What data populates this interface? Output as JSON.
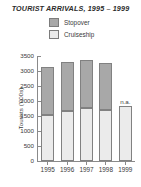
{
  "chart_data": {
    "type": "bar",
    "subtype": "stacked-bar",
    "title": "TOURIST ARRIVALS, 1995 – 1999",
    "xlabel": "",
    "ylabel": "Tourists ('000s)",
    "categories": [
      "1995",
      "1996",
      "1997",
      "1998",
      "1999"
    ],
    "series": [
      {
        "name": "Cruiseship",
        "color": "#ebebeb",
        "values": [
          1520,
          1680,
          1760,
          1710,
          1840
        ]
      },
      {
        "name": "Stopover",
        "color": "#a8a8a8",
        "values": [
          1630,
          1630,
          1610,
          1560,
          null
        ]
      }
    ],
    "totals": [
      3150,
      3310,
      3370,
      3270,
      1840
    ],
    "ylim": [
      0,
      3500
    ],
    "yticks": [
      0,
      500,
      1000,
      1500,
      2000,
      2500,
      3000,
      3500
    ],
    "ytick_labels": [
      "0",
      "500",
      "1000",
      "1500",
      "2000",
      "2500",
      "3000",
      "3500"
    ],
    "grid": false,
    "legend_position": "top-center",
    "annotations": [
      {
        "category": "1999",
        "text": "n.a.",
        "series": "Stopover"
      }
    ]
  },
  "legend": {
    "items": [
      {
        "label": "Stopover",
        "swatch": "#a8a8a8"
      },
      {
        "label": "Cruiseship",
        "swatch": "#ebebeb"
      }
    ]
  }
}
